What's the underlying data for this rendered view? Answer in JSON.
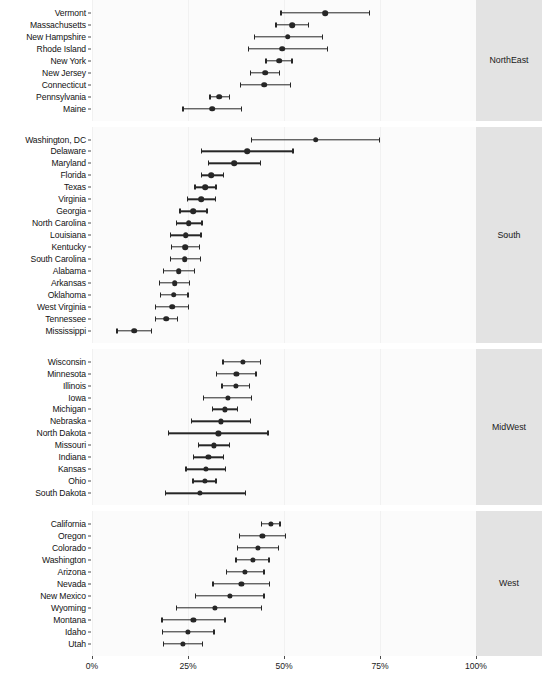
{
  "chart_data": {
    "type": "scatter",
    "title": "",
    "subtitle": "",
    "xlabel": "",
    "ylabel": "",
    "xlim": [
      0,
      100
    ],
    "xtick_values": [
      0,
      25,
      50,
      75,
      100
    ],
    "xtick_labels": [
      "0%",
      "25%",
      "50%",
      "75%",
      "100%"
    ],
    "grid": true,
    "legend_position": "none",
    "orientation": "horizontal",
    "marker": "filled-circle-with-error-bars",
    "units": "percent",
    "panel_label_position": "right",
    "panels": [
      {
        "name": "NorthEast",
        "rows": [
          {
            "label": "Vermont",
            "value": 60.7,
            "low": 49.0,
            "high": 72.4
          },
          {
            "label": "Massachusetts",
            "value": 52.1,
            "low": 47.7,
            "high": 56.5
          },
          {
            "label": "New Hampshire",
            "value": 51.0,
            "low": 42.2,
            "high": 60.2
          },
          {
            "label": "Rhode Island",
            "value": 49.5,
            "low": 40.6,
            "high": 61.5
          },
          {
            "label": "New York",
            "value": 48.7,
            "low": 45.1,
            "high": 52.3
          },
          {
            "label": "New Jersey",
            "value": 45.1,
            "low": 41.1,
            "high": 49.0
          },
          {
            "label": "Connecticut",
            "value": 44.8,
            "low": 38.5,
            "high": 51.8
          },
          {
            "label": "Pennsylvania",
            "value": 33.2,
            "low": 30.5,
            "high": 36.0
          },
          {
            "label": "Maine",
            "value": 31.3,
            "low": 23.5,
            "high": 39.1
          }
        ]
      },
      {
        "name": "South",
        "rows": [
          {
            "label": "Washington, DC",
            "value": 58.3,
            "low": 41.4,
            "high": 75.1
          },
          {
            "label": "Delaware",
            "value": 40.4,
            "low": 28.4,
            "high": 52.5
          },
          {
            "label": "Maryland",
            "value": 37.0,
            "low": 30.2,
            "high": 44.0
          },
          {
            "label": "Florida",
            "value": 31.1,
            "low": 28.3,
            "high": 34.5
          },
          {
            "label": "Texas",
            "value": 29.5,
            "low": 26.6,
            "high": 32.5
          },
          {
            "label": "Virginia",
            "value": 28.4,
            "low": 24.7,
            "high": 32.3
          },
          {
            "label": "Georgia",
            "value": 26.4,
            "low": 22.7,
            "high": 30.1
          },
          {
            "label": "North Carolina",
            "value": 25.2,
            "low": 21.9,
            "high": 28.8
          },
          {
            "label": "Louisiana",
            "value": 24.4,
            "low": 20.3,
            "high": 28.6
          },
          {
            "label": "Kentucky",
            "value": 24.2,
            "low": 20.5,
            "high": 28.2
          },
          {
            "label": "South Carolina",
            "value": 24.1,
            "low": 20.3,
            "high": 28.4
          },
          {
            "label": "Alabama",
            "value": 22.6,
            "low": 18.5,
            "high": 26.8
          },
          {
            "label": "Arkansas",
            "value": 21.5,
            "low": 17.4,
            "high": 25.6
          },
          {
            "label": "Oklahoma",
            "value": 21.3,
            "low": 17.6,
            "high": 25.2
          },
          {
            "label": "West Virginia",
            "value": 20.9,
            "low": 16.3,
            "high": 25.3
          },
          {
            "label": "Tennessee",
            "value": 19.4,
            "low": 16.4,
            "high": 22.5
          },
          {
            "label": "Mississippi",
            "value": 11.0,
            "low": 6.3,
            "high": 15.7
          }
        ]
      },
      {
        "name": "MidWest",
        "rows": [
          {
            "label": "Wisconsin",
            "value": 39.2,
            "low": 33.9,
            "high": 44.1
          },
          {
            "label": "Minnesota",
            "value": 37.6,
            "low": 32.3,
            "high": 42.9
          },
          {
            "label": "Illinois",
            "value": 37.4,
            "low": 33.7,
            "high": 41.2
          },
          {
            "label": "Iowa",
            "value": 35.3,
            "low": 28.8,
            "high": 41.7
          },
          {
            "label": "Michigan",
            "value": 34.6,
            "low": 31.2,
            "high": 38.0
          },
          {
            "label": "Nebraska",
            "value": 33.5,
            "low": 25.8,
            "high": 41.4
          },
          {
            "label": "North Dakota",
            "value": 32.9,
            "low": 19.8,
            "high": 46.0
          },
          {
            "label": "Missouri",
            "value": 31.8,
            "low": 27.5,
            "high": 36.0
          },
          {
            "label": "Indiana",
            "value": 30.3,
            "low": 26.2,
            "high": 34.4
          },
          {
            "label": "Kansas",
            "value": 29.7,
            "low": 24.3,
            "high": 35.0
          },
          {
            "label": "Ohio",
            "value": 29.3,
            "low": 26.1,
            "high": 32.5
          },
          {
            "label": "South Dakota",
            "value": 28.1,
            "low": 19.0,
            "high": 40.2
          }
        ]
      },
      {
        "name": "West",
        "rows": [
          {
            "label": "California",
            "value": 46.6,
            "low": 44.0,
            "high": 49.1
          },
          {
            "label": "Oregon",
            "value": 44.4,
            "low": 38.3,
            "high": 50.6
          },
          {
            "label": "Colorado",
            "value": 43.2,
            "low": 37.7,
            "high": 48.8
          },
          {
            "label": "Washington",
            "value": 41.8,
            "low": 37.3,
            "high": 46.3
          },
          {
            "label": "Arizona",
            "value": 39.9,
            "low": 34.9,
            "high": 45.0
          },
          {
            "label": "Nevada",
            "value": 38.9,
            "low": 31.3,
            "high": 46.4
          },
          {
            "label": "New Mexico",
            "value": 35.9,
            "low": 26.8,
            "high": 45.0
          },
          {
            "label": "Wyoming",
            "value": 32.1,
            "low": 21.8,
            "high": 44.3
          },
          {
            "label": "Montana",
            "value": 26.4,
            "low": 18.0,
            "high": 34.8
          },
          {
            "label": "Idaho",
            "value": 25.0,
            "low": 18.1,
            "high": 32.0
          },
          {
            "label": "Utah",
            "value": 23.6,
            "low": 18.4,
            "high": 28.9
          }
        ]
      }
    ]
  }
}
